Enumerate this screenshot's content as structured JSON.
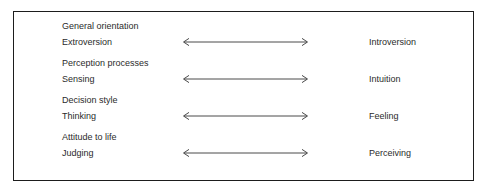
{
  "diagram": {
    "title": "",
    "border_color": "#1d1d1d",
    "background_color": "#ffffff",
    "text_color": "#2b2b2b",
    "arrow_color": "#4a4a4a",
    "arrow_icon": "left-right-arrow-icon",
    "dimensions": [
      {
        "category": "General orientation",
        "left_pole": "Extroversion",
        "right_pole": "Introversion"
      },
      {
        "category": "Perception processes",
        "left_pole": "Sensing",
        "right_pole": "Intuition"
      },
      {
        "category": "Decision style",
        "left_pole": "Thinking",
        "right_pole": "Feeling"
      },
      {
        "category": "Attitude to life",
        "left_pole": "Judging",
        "right_pole": "Perceiving"
      }
    ]
  }
}
